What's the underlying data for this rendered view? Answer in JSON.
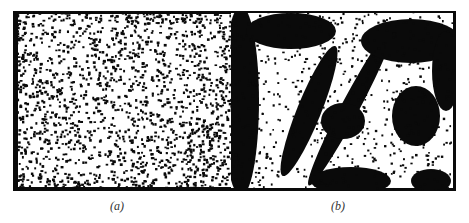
{
  "figure": {
    "panels": [
      {
        "id": "a",
        "label": "(a)",
        "description": "noisy speckle image, dense salt-and-pepper noise, uniform texture"
      },
      {
        "id": "b",
        "label": "(b)",
        "description": "filtered image revealing dark blobs and diagonal stripes with residual speckle"
      }
    ]
  },
  "colors": {
    "ink": "#0a0a0a",
    "paper": "#ffffff"
  }
}
